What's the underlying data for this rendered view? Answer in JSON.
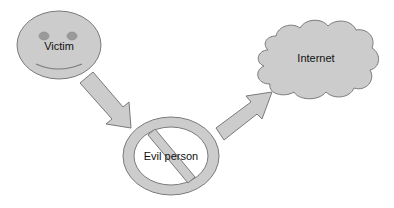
{
  "diagram": {
    "type": "flow",
    "nodes": [
      {
        "id": "victim",
        "label": "Victim",
        "shape": "smiley-face"
      },
      {
        "id": "evil_person",
        "label": "Evil person",
        "shape": "prohibition-sign"
      },
      {
        "id": "internet",
        "label": "Internet",
        "shape": "cloud"
      }
    ],
    "edges": [
      {
        "from": "victim",
        "to": "evil_person",
        "style": "block-arrow"
      },
      {
        "from": "evil_person",
        "to": "internet",
        "style": "block-arrow"
      }
    ]
  },
  "labels": {
    "victim": "Victim",
    "evil_person": "Evil person",
    "internet": "Internet"
  },
  "colors": {
    "fill": "#cccccc",
    "stroke": "#7a7a7a",
    "eye": "#9a9a9a",
    "text": "#111111"
  }
}
